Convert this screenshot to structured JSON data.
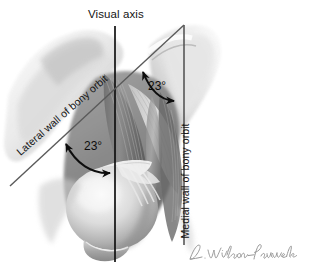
{
  "figure": {
    "background_color": "#ffffff",
    "line_color": "#111111",
    "annotation_color": "#0d0d0d",
    "artwork_description": "Grayscale anatomical illustration of the right orbit viewed from above, showing the globe, extraocular muscles, optic nerve and surrounding bone"
  },
  "labels": {
    "visual_axis": "Visual axis",
    "lateral_wall": "Lateral wall of bony orbit",
    "medial_wall": "Medial wall of bony orbit"
  },
  "angles": {
    "upper": "23°",
    "lower": "23°"
  },
  "signature": {
    "artist": "L. Wilson-Pauwels"
  }
}
